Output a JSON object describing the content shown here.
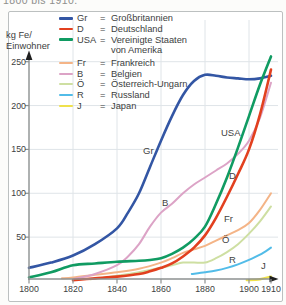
{
  "caption": {
    "text": "1800 bis 1910."
  },
  "chart_data": {
    "type": "line",
    "title": "",
    "xlabel": "",
    "ylabel": "kg Fe/Einwohner",
    "ylabel_lines": [
      "kg Fe/",
      "Einwohner"
    ],
    "xlim": [
      1800,
      1910
    ],
    "ylim": [
      0,
      250
    ],
    "x_ticks": [
      1800,
      1820,
      1840,
      1860,
      1880,
      1900,
      1910
    ],
    "y_ticks": [
      50,
      100,
      150,
      200,
      250
    ],
    "grid": true,
    "legend_position": "top-left",
    "legend_equals_sign": "=",
    "axis_color": "#8c9090",
    "grid_color": "#dfe4e8",
    "text_color": "#3c3e3e",
    "series": [
      {
        "id": "gr",
        "abbr": "Gr",
        "name": "Großbritannien",
        "name_lines": [
          "Großbritannien"
        ],
        "color": "#3356a4",
        "width": 2.6,
        "points": [
          [
            1800,
            15
          ],
          [
            1810,
            21
          ],
          [
            1820,
            29
          ],
          [
            1830,
            42
          ],
          [
            1840,
            60
          ],
          [
            1845,
            78
          ],
          [
            1850,
            100
          ],
          [
            1855,
            130
          ],
          [
            1860,
            160
          ],
          [
            1865,
            188
          ],
          [
            1870,
            212
          ],
          [
            1875,
            228
          ],
          [
            1880,
            235
          ],
          [
            1885,
            234
          ],
          [
            1890,
            232
          ],
          [
            1895,
            231
          ],
          [
            1900,
            230
          ],
          [
            1905,
            231
          ],
          [
            1910,
            234
          ]
        ]
      },
      {
        "id": "d",
        "abbr": "D",
        "name": "Deutschland",
        "name_lines": [
          "Deutschland"
        ],
        "color": "#e2401f",
        "width": 2.6,
        "points": [
          [
            1820,
            1
          ],
          [
            1830,
            3
          ],
          [
            1840,
            5
          ],
          [
            1850,
            8
          ],
          [
            1855,
            11
          ],
          [
            1860,
            15
          ],
          [
            1865,
            20
          ],
          [
            1870,
            28
          ],
          [
            1875,
            38
          ],
          [
            1880,
            52
          ],
          [
            1885,
            72
          ],
          [
            1890,
            96
          ],
          [
            1895,
            122
          ],
          [
            1900,
            150
          ],
          [
            1905,
            190
          ],
          [
            1910,
            241
          ]
        ]
      },
      {
        "id": "usa",
        "abbr": "USA",
        "name": "Vereinigte Staaten von Amerika",
        "name_lines": [
          "Vereinigte Staaten",
          "von Amerika"
        ],
        "color": "#109b62",
        "width": 2.6,
        "points": [
          [
            1800,
            4
          ],
          [
            1810,
            10
          ],
          [
            1820,
            18
          ],
          [
            1830,
            20
          ],
          [
            1840,
            22
          ],
          [
            1850,
            23
          ],
          [
            1855,
            24
          ],
          [
            1860,
            26
          ],
          [
            1865,
            31
          ],
          [
            1870,
            38
          ],
          [
            1875,
            48
          ],
          [
            1880,
            62
          ],
          [
            1885,
            88
          ],
          [
            1890,
            118
          ],
          [
            1895,
            152
          ],
          [
            1900,
            188
          ],
          [
            1905,
            224
          ],
          [
            1910,
            256
          ]
        ]
      },
      {
        "id": "fr",
        "abbr": "Fr",
        "name": "Frankreich",
        "name_lines": [
          "Frankreich"
        ],
        "color": "#f4b487",
        "width": 2,
        "points": [
          [
            1815,
            3
          ],
          [
            1820,
            4
          ],
          [
            1830,
            7
          ],
          [
            1840,
            10
          ],
          [
            1850,
            14
          ],
          [
            1860,
            21
          ],
          [
            1865,
            26
          ],
          [
            1870,
            32
          ],
          [
            1875,
            36
          ],
          [
            1880,
            40
          ],
          [
            1885,
            46
          ],
          [
            1890,
            52
          ],
          [
            1895,
            58
          ],
          [
            1900,
            66
          ],
          [
            1905,
            81
          ],
          [
            1910,
            100
          ]
        ]
      },
      {
        "id": "b",
        "abbr": "B",
        "name": "Belgien",
        "name_lines": [
          "Belgien"
        ],
        "color": "#dca3c6",
        "width": 2,
        "points": [
          [
            1820,
            2
          ],
          [
            1830,
            8
          ],
          [
            1840,
            18
          ],
          [
            1845,
            28
          ],
          [
            1850,
            42
          ],
          [
            1855,
            62
          ],
          [
            1860,
            78
          ],
          [
            1865,
            88
          ],
          [
            1870,
            100
          ],
          [
            1875,
            110
          ],
          [
            1880,
            118
          ],
          [
            1885,
            126
          ],
          [
            1890,
            134
          ],
          [
            1895,
            145
          ],
          [
            1900,
            160
          ],
          [
            1905,
            186
          ],
          [
            1910,
            226
          ]
        ]
      },
      {
        "id": "oe",
        "abbr": "Ö",
        "name": "Österreich-Ungarn",
        "name_lines": [
          "Österreich-Ungarn"
        ],
        "color": "#cedfa2",
        "width": 2,
        "points": [
          [
            1828,
            2
          ],
          [
            1840,
            6
          ],
          [
            1850,
            10
          ],
          [
            1860,
            15
          ],
          [
            1865,
            18
          ],
          [
            1870,
            21
          ],
          [
            1875,
            21
          ],
          [
            1880,
            21
          ],
          [
            1885,
            26
          ],
          [
            1890,
            33
          ],
          [
            1895,
            42
          ],
          [
            1900,
            54
          ],
          [
            1905,
            68
          ],
          [
            1910,
            85
          ]
        ]
      },
      {
        "id": "r",
        "abbr": "R",
        "name": "Russland",
        "name_lines": [
          "Russland"
        ],
        "color": "#52bce8",
        "width": 2,
        "points": [
          [
            1874,
            8
          ],
          [
            1880,
            10
          ],
          [
            1885,
            12
          ],
          [
            1890,
            15
          ],
          [
            1895,
            19
          ],
          [
            1900,
            24
          ],
          [
            1905,
            30
          ],
          [
            1910,
            38
          ]
        ]
      },
      {
        "id": "j",
        "abbr": "J",
        "name": "Japan",
        "name_lines": [
          "Japan"
        ],
        "color": "#efe14c",
        "width": 2.4,
        "points": [
          [
            1899,
            1
          ],
          [
            1905,
            2
          ],
          [
            1910,
            5
          ]
        ]
      }
    ]
  }
}
